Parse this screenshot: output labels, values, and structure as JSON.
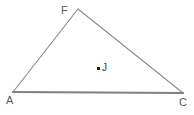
{
  "figure": {
    "type": "geometry-triangle",
    "canvas": {
      "width": 194,
      "height": 115,
      "background": "#ffffff"
    },
    "colors": {
      "base_edge": "#808080",
      "side_edge": "#8a8a8c",
      "label": "#59595b",
      "point_marker": "#1c1c1c",
      "point_label": "#3a3a3c"
    },
    "vertices": [
      {
        "name": "A",
        "label": "A",
        "x": 13,
        "y": 92,
        "label_x": 6,
        "label_y": 95
      },
      {
        "name": "F",
        "label": "F",
        "x": 78,
        "y": 9,
        "label_x": 61,
        "label_y": 5
      },
      {
        "name": "C",
        "label": "C",
        "x": 183,
        "y": 93,
        "label_x": 179,
        "label_y": 97
      }
    ],
    "edges": [
      {
        "name": "edge-AC",
        "from": "A",
        "to": "C",
        "width": 2.2,
        "color": "#808080"
      },
      {
        "name": "edge-AF",
        "from": "A",
        "to": "F",
        "width": 1.1,
        "color": "#8a8a8c"
      },
      {
        "name": "edge-FC",
        "from": "F",
        "to": "C",
        "width": 1.1,
        "color": "#8a8a8c"
      }
    ],
    "interior_points": [
      {
        "name": "J",
        "label": "J",
        "x": 98,
        "y": 68,
        "label_x": 102,
        "label_y": 63
      }
    ]
  }
}
